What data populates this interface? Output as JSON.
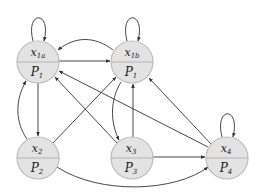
{
  "diagram": {
    "type": "directed-graph",
    "node_fill": "#e3e3e3",
    "node_stroke": "#bdbdbd",
    "edge_color": "#333333",
    "nodes": [
      {
        "id": "x1a",
        "top_var": "x",
        "top_sub": "1a",
        "bottom_var": "P",
        "bottom_sub": "1",
        "cx": 38,
        "cy": 62
      },
      {
        "id": "x1b",
        "top_var": "x",
        "top_sub": "1b",
        "bottom_var": "P",
        "bottom_sub": "1",
        "cx": 132,
        "cy": 62
      },
      {
        "id": "x2",
        "top_var": "x",
        "top_sub": "2",
        "bottom_var": "P",
        "bottom_sub": "2",
        "cx": 38,
        "cy": 158
      },
      {
        "id": "x3",
        "top_var": "x",
        "top_sub": "3",
        "bottom_var": "P",
        "bottom_sub": "3",
        "cx": 132,
        "cy": 158
      },
      {
        "id": "x4",
        "top_var": "x",
        "top_sub": "4",
        "bottom_var": "P",
        "bottom_sub": "4",
        "cx": 227,
        "cy": 158
      }
    ],
    "edges": [
      {
        "from": "x1a",
        "to": "x1a",
        "kind": "self-loop"
      },
      {
        "from": "x1b",
        "to": "x1b",
        "kind": "self-loop"
      },
      {
        "from": "x4",
        "to": "x4",
        "kind": "self-loop"
      },
      {
        "from": "x1a",
        "to": "x1b",
        "kind": "straight"
      },
      {
        "from": "x1b",
        "to": "x1a",
        "kind": "curved"
      },
      {
        "from": "x1a",
        "to": "x2",
        "kind": "straight"
      },
      {
        "from": "x2",
        "to": "x1a",
        "kind": "curved"
      },
      {
        "from": "x2",
        "to": "x1b",
        "kind": "straight"
      },
      {
        "from": "x3",
        "to": "x1a",
        "kind": "straight"
      },
      {
        "from": "x1b",
        "to": "x3",
        "kind": "curved"
      },
      {
        "from": "x3",
        "to": "x1b",
        "kind": "straight"
      },
      {
        "from": "x4",
        "to": "x1a",
        "kind": "straight"
      },
      {
        "from": "x4",
        "to": "x1b",
        "kind": "straight"
      },
      {
        "from": "x3",
        "to": "x4",
        "kind": "straight"
      },
      {
        "from": "x2",
        "to": "x4",
        "kind": "curved"
      }
    ]
  }
}
